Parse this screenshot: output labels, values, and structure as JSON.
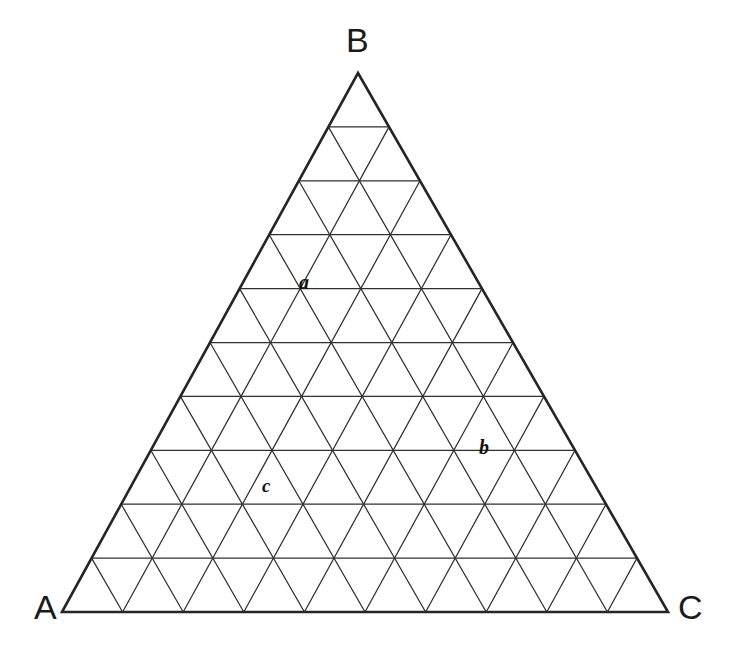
{
  "figure": {
    "type": "ternary-diagram",
    "title": "",
    "background_color": "#ffffff",
    "line_color": "#303030",
    "text_color": "#1b1b1b"
  },
  "chart_data": {
    "type": "scatter",
    "plot_kind": "ternary-triangle-grid",
    "title": "",
    "xlabel": "",
    "ylabel": "",
    "grid": true,
    "grid_divisions": 10,
    "axes": [
      {
        "name": "A",
        "vertex_label": "A",
        "corner": "bottom-left"
      },
      {
        "name": "B",
        "vertex_label": "B",
        "corner": "top"
      },
      {
        "name": "C",
        "vertex_label": "C",
        "corner": "bottom-right"
      }
    ],
    "vertices": {
      "A": {
        "label": "A",
        "x": 62,
        "y": 612
      },
      "B": {
        "label": "B",
        "x": 358,
        "y": 73
      },
      "C": {
        "label": "C",
        "x": 668,
        "y": 612
      }
    },
    "points": [
      {
        "label": "a",
        "A": 30,
        "B": 60,
        "C": 10,
        "px": 305,
        "py": 283
      },
      {
        "label": "b",
        "A": 20,
        "B": 30,
        "C": 50,
        "px": 485,
        "py": 448
      },
      {
        "label": "c",
        "A": 45,
        "B": 25,
        "C": 30,
        "px": 268,
        "py": 487
      }
    ],
    "legend": [],
    "annotations": [
      "a",
      "b",
      "c"
    ]
  },
  "labels": {
    "vertex_a": "A",
    "vertex_b": "B",
    "vertex_c": "C",
    "point_a": "a",
    "point_b": "b",
    "point_c": "c"
  }
}
